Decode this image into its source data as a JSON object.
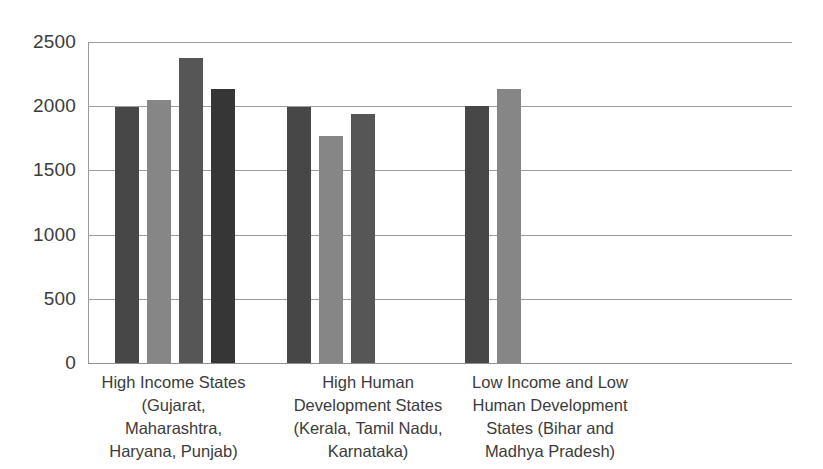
{
  "chart_data": {
    "type": "bar",
    "title": "",
    "xlabel": "",
    "ylabel": "",
    "ylim": [
      0,
      2500
    ],
    "ytick_values": [
      2500,
      2000,
      1500,
      1000,
      500,
      0
    ],
    "ytick_labels": [
      "2500",
      "2000",
      "1500",
      "1000",
      "500",
      "0"
    ],
    "grid": true,
    "legend": "none",
    "categories": [
      "High Income States\n(Gujarat,\nMaharashtra,\nHaryana, Punjab)",
      "High Human\nDevelopment States\n(Kerala, Tamil Nadu,\nKarnataka)",
      "Low Income and Low\nHuman Development\nStates (Bihar and\nMadhya Pradesh)"
    ],
    "groups": [
      {
        "category": "High Income States (Gujarat, Maharashtra, Haryana, Punjab)",
        "bars": [
          {
            "value": 1990,
            "color": "#474747"
          },
          {
            "value": 2050,
            "color": "#868686"
          },
          {
            "value": 2375,
            "color": "#565656"
          },
          {
            "value": 2135,
            "color": "#363636"
          }
        ]
      },
      {
        "category": "High Human Development States (Kerala, Tamil Nadu, Karnataka)",
        "bars": [
          {
            "value": 1990,
            "color": "#474747"
          },
          {
            "value": 1765,
            "color": "#868686"
          },
          {
            "value": 1940,
            "color": "#565656"
          }
        ]
      },
      {
        "category": "Low Income and Low Human Development States (Bihar and Madhya Pradesh)",
        "bars": [
          {
            "value": 2000,
            "color": "#474747"
          },
          {
            "value": 2135,
            "color": "#868686"
          }
        ]
      }
    ],
    "colors": {
      "series_1": "#474747",
      "series_2": "#868686",
      "series_3": "#565656",
      "series_4": "#363636",
      "gridline": "#9d9d9d",
      "text": "#3b3b3b",
      "background": "#ffffff"
    }
  },
  "layout": {
    "plot_left_px": 88,
    "plot_top_px": 42,
    "plot_width_px": 704,
    "plot_height_px": 321,
    "bar_width_px": 24,
    "bar_gap_px": 8,
    "group_start_px": [
      27,
      199,
      377
    ]
  }
}
